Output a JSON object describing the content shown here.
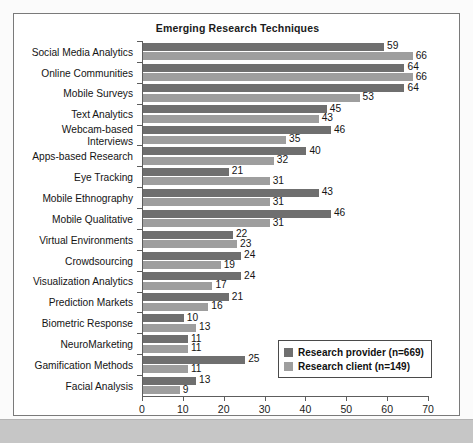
{
  "chart_data": {
    "type": "bar",
    "orientation": "horizontal",
    "title": "Emerging Research Techniques",
    "xlabel": "",
    "ylabel": "",
    "xlim": [
      0,
      70
    ],
    "xticks": [
      0,
      10,
      20,
      30,
      40,
      50,
      60,
      70
    ],
    "grid": false,
    "legend_position": "lower-right-inside",
    "categories": [
      "Social Media Analytics",
      "Online Communities",
      "Mobile Surveys",
      "Text Analytics",
      "Webcam-based\nInterviews",
      "Apps-based Research",
      "Eye Tracking",
      "Mobile Ethnography",
      "Mobile Qualitative",
      "Virtual Environments",
      "Crowdsourcing",
      "Visualization Analytics",
      "Prediction Markets",
      "Biometric Response",
      "NeuroMarketing",
      "Gamification Methods",
      "Facial Analysis"
    ],
    "series": [
      {
        "name": "Research provider (n=669)",
        "color": "#6f6f6f",
        "values": [
          59,
          64,
          64,
          45,
          46,
          40,
          21,
          43,
          46,
          22,
          24,
          24,
          21,
          10,
          11,
          25,
          13
        ]
      },
      {
        "name": "Research client (n=149)",
        "color": "#9e9e9e",
        "values": [
          66,
          66,
          53,
          43,
          35,
          32,
          31,
          31,
          31,
          23,
          19,
          17,
          16,
          13,
          11,
          11,
          9
        ]
      }
    ]
  },
  "legend": {
    "items": [
      {
        "label": "Research provider (n=669)"
      },
      {
        "label": "Research client (n=149)"
      }
    ]
  }
}
